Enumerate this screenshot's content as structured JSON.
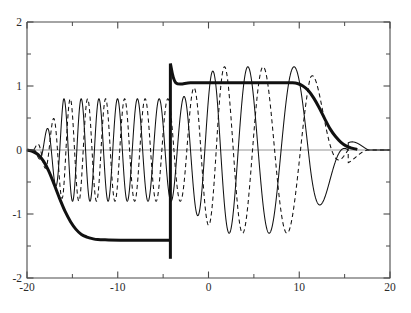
{
  "chart_data": {
    "type": "line",
    "title": "",
    "subtitle": "",
    "xlabel": "",
    "ylabel": "",
    "xlim": [
      -20,
      20
    ],
    "ylim": [
      -2,
      2
    ],
    "grid": false,
    "legend": "none",
    "zero_line": true,
    "x_ticks_major": [
      -20,
      -10,
      0,
      10,
      20
    ],
    "x_ticks_major_labels": [
      "-20",
      "-10",
      "0",
      "10",
      "20"
    ],
    "x_ticks_minor": [
      -15,
      -5,
      5,
      15
    ],
    "y_ticks_major": [
      2,
      1,
      0,
      -1,
      -2
    ],
    "y_ticks_major_labels": [
      "2",
      "1",
      "0",
      "-1",
      "-2"
    ],
    "y_ticks_minor": [
      1.5,
      0.5,
      -0.5,
      -1.5
    ],
    "discontinuity_x": -4.2,
    "discontinuity_from": -1.7,
    "discontinuity_to": 1.35,
    "series": [
      {
        "name": "mean-envelope",
        "style": "solid-thick",
        "color": "#111111",
        "linewidth": 3.0,
        "points_x": [
          -20.0,
          -19.4,
          -18.8,
          -18.2,
          -17.6,
          -17.0,
          -16.4,
          -15.8,
          -15.2,
          -14.6,
          -14.0,
          -13.4,
          -12.8,
          -12.2,
          -11.0,
          -9.0,
          -7.0,
          -5.0,
          -4.25,
          -4.2,
          -3.6,
          -2.0,
          0.0,
          2.0,
          4.0,
          6.0,
          8.0,
          9.2,
          9.8,
          10.4,
          11.0,
          11.6,
          12.2,
          12.8,
          13.4,
          14.0,
          14.6,
          15.2,
          15.8,
          16.4,
          17.0,
          18.0,
          19.0,
          20.0
        ],
        "points_y": [
          0.0,
          -0.02,
          -0.07,
          -0.17,
          -0.33,
          -0.54,
          -0.76,
          -0.96,
          -1.12,
          -1.24,
          -1.32,
          -1.36,
          -1.385,
          -1.4,
          -1.405,
          -1.41,
          -1.41,
          -1.41,
          -1.41,
          1.35,
          1.05,
          1.05,
          1.05,
          1.05,
          1.05,
          1.05,
          1.05,
          1.05,
          1.04,
          1.0,
          0.93,
          0.81,
          0.66,
          0.49,
          0.33,
          0.21,
          0.12,
          0.06,
          0.03,
          0.01,
          0.0,
          0.0,
          0.0,
          0.0
        ]
      },
      {
        "name": "oscillation-solid",
        "style": "solid-thin",
        "color": "#111111",
        "linewidth": 1.05,
        "amplitude_left": 0.8,
        "amplitude_right": 1.3,
        "description": "decreasing-frequency chirp, solid, riding on zero baseline"
      },
      {
        "name": "oscillation-dashed",
        "style": "dashed",
        "color": "#111111",
        "linewidth": 1.05,
        "amplitude_left": 0.8,
        "amplitude_right": 1.3,
        "description": "decreasing-frequency chirp, dashed, phase shifted relative to solid"
      }
    ]
  },
  "axes": {
    "frame_color": "#4a4a4a",
    "zero_line_color": "#888888",
    "curve_color": "#111111",
    "background": "#ffffff"
  }
}
